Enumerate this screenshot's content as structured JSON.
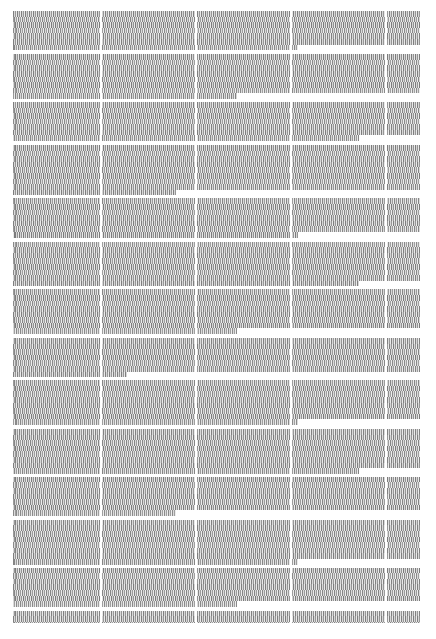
{
  "page": {
    "width": 436,
    "height": 639,
    "background_color": "#ffffff"
  },
  "text_block": {
    "left": 13,
    "top": 11,
    "right": 420,
    "bottom": 623,
    "width": 407,
    "height": 612,
    "ink_color": "#9a9a9a",
    "line_height": 5.6,
    "legible_text": null,
    "note": "No glyph, word, heading, page number, header or footer is legible at the rendered resolution."
  },
  "column_grid": {
    "count": 5,
    "gutter_color": "#ffffff",
    "gutter_width": 2,
    "gutter_x": [
      100,
      195,
      290,
      385
    ]
  },
  "paragraph_breaks": {
    "gap_color": "#ffffff",
    "note": "Irregularly spaced white horizontal bands separating blocks of lines.",
    "after_line_index": [
      7,
      15,
      22,
      31,
      38,
      46,
      54,
      61,
      69,
      77,
      84,
      92,
      99
    ]
  },
  "blocks": [
    {
      "lines": 7,
      "last_line_width": "short-70",
      "gap": 4
    },
    {
      "lines": 8,
      "last_line_width": "short-55",
      "gap": 3
    },
    {
      "lines": 7,
      "last_line_width": "short-85",
      "gap": 4
    },
    {
      "lines": 9,
      "last_line_width": "short-40",
      "gap": 3
    },
    {
      "lines": 7,
      "last_line_width": "short-70",
      "gap": 4
    },
    {
      "lines": 8,
      "last_line_width": "short-85",
      "gap": 3
    },
    {
      "lines": 8,
      "last_line_width": "short-55",
      "gap": 4
    },
    {
      "lines": 7,
      "last_line_width": "short-28",
      "gap": 3
    },
    {
      "lines": 8,
      "last_line_width": "short-70",
      "gap": 4
    },
    {
      "lines": 8,
      "last_line_width": "short-85",
      "gap": 3
    },
    {
      "lines": 7,
      "last_line_width": "short-40",
      "gap": 4
    },
    {
      "lines": 8,
      "last_line_width": "short-70",
      "gap": 3
    },
    {
      "lines": 7,
      "last_line_width": "short-55",
      "gap": 4
    },
    {
      "lines": 8,
      "last_line_width": "short-85",
      "gap": 3
    },
    {
      "lines": 9,
      "last_line_width": "short-70",
      "gap": 0
    }
  ]
}
